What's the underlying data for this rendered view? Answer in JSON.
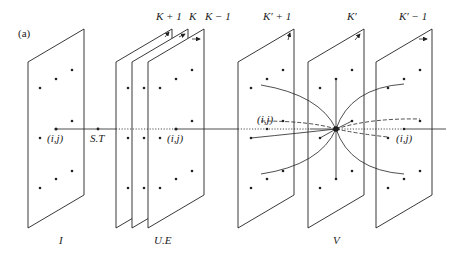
{
  "figure": {
    "panel_label": "(a)",
    "layers": [
      {
        "id": "I",
        "label": "I"
      },
      {
        "id": "UE",
        "label": "U.E"
      },
      {
        "id": "V",
        "label": "V"
      }
    ],
    "top_labels": {
      "k_plus_1": "K + 1",
      "k": "K",
      "k_minus_1": "K − 1",
      "kp_plus_1": "K′ + 1",
      "kp": "K′",
      "kp_minus_1": "K′ − 1"
    },
    "node_labels": {
      "ij_input": "(i,j)",
      "st": "S.T",
      "ij_ue": "(i,j)",
      "ij_v_left": "(i,j)",
      "ij_v_right": "(i,j)"
    },
    "colors": {
      "stroke": "#222222",
      "background": "#ffffff"
    }
  }
}
